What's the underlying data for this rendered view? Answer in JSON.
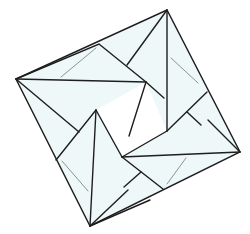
{
  "figure": {
    "colors": {
      "background": "#ffffff",
      "paper_fill": "#eef8f8",
      "edge_stroke": "#1e1e1e",
      "crease_stroke": "#7a8a8a"
    },
    "outer_corners": {
      "left": [
        16,
        79
      ],
      "top": [
        167,
        10
      ],
      "right": [
        240,
        152
      ],
      "bottom": [
        90,
        226
      ]
    },
    "flaps": [
      {
        "name": "top-left-flap",
        "points": [
          [
            16,
            79
          ],
          [
            99,
            44
          ],
          [
            146,
            82
          ]
        ],
        "crease": [
          [
            96,
            48
          ],
          [
            61,
            77
          ]
        ]
      },
      {
        "name": "top-right-flap",
        "points": [
          [
            167,
            10
          ],
          [
            207,
            92
          ],
          [
            167,
            131
          ]
        ],
        "crease": [
          [
            171,
            58
          ],
          [
            198,
            83
          ]
        ]
      },
      {
        "name": "bottom-right-flap",
        "points": [
          [
            240,
            152
          ],
          [
            163,
            189
          ],
          [
            122,
            157
          ]
        ],
        "crease": [
          [
            186,
            158
          ],
          [
            167,
            184
          ]
        ]
      },
      {
        "name": "bottom-left-flap",
        "points": [
          [
            90,
            226
          ],
          [
            56,
            160
          ],
          [
            96,
            110
          ]
        ],
        "crease": [
          [
            62,
            161
          ],
          [
            88,
            191
          ]
        ]
      }
    ]
  }
}
